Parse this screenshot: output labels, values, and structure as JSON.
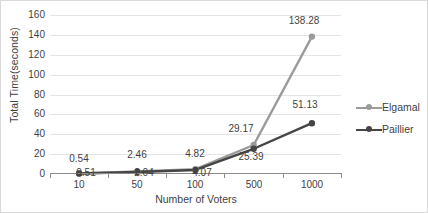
{
  "chart_data": {
    "type": "line",
    "title": "",
    "xlabel": "Number of Voters",
    "ylabel": "Total Time(seconds)",
    "categories": [
      "10",
      "50",
      "100",
      "500",
      "1000"
    ],
    "ylim": [
      0,
      160
    ],
    "yticks": [
      "160",
      "140",
      "120",
      "100",
      "80",
      "60",
      "40",
      "20",
      "0"
    ],
    "ytick_step": 20,
    "grid": true,
    "legend_position": "right",
    "series": [
      {
        "name": "Elgamal",
        "color": "#9b9b9b",
        "values": [
          0.54,
          2.46,
          4.82,
          29.17,
          138.28
        ],
        "labels": [
          "0.54",
          "2.46",
          "4.82",
          "29.17",
          "138.28"
        ]
      },
      {
        "name": "Paillier",
        "color": "#454545",
        "values": [
          0.51,
          2.04,
          4.07,
          25.39,
          51.13
        ],
        "labels": [
          "0.51",
          "2.04",
          "4.07",
          "25.39",
          "51.13"
        ]
      }
    ]
  }
}
